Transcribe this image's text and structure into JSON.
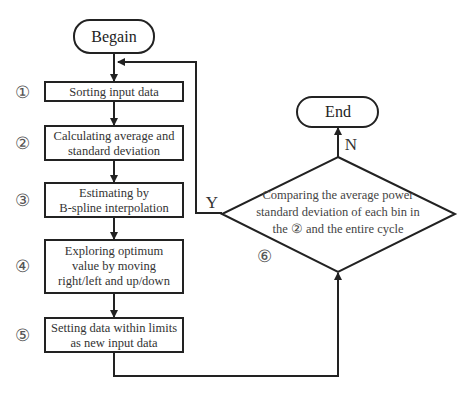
{
  "diagram": {
    "type": "flowchart",
    "start": {
      "label": "Begain"
    },
    "end": {
      "label": "End"
    },
    "steps": [
      {
        "number": "①",
        "lines": [
          "Sorting input data"
        ]
      },
      {
        "number": "②",
        "lines": [
          "Calculating average and",
          "standard deviation"
        ]
      },
      {
        "number": "③",
        "lines": [
          "Estimating by",
          "B-spline interpolation"
        ]
      },
      {
        "number": "④",
        "lines": [
          "Exploring optimum",
          "value by moving",
          "right/left and up/down"
        ]
      },
      {
        "number": "⑤",
        "lines": [
          "Setting data within limits",
          "as new input data"
        ]
      }
    ],
    "decision": {
      "number": "⑥",
      "lines": [
        "Comparing the average power",
        "standard deviation of each bin in",
        "the ② and the entire cycle"
      ],
      "yes_label": "Y",
      "no_label": "N"
    }
  }
}
